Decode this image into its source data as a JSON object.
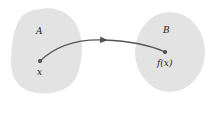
{
  "diagram": {
    "set_a": {
      "label": "A",
      "point_label": "x",
      "fill": "#e3e3e3"
    },
    "set_b": {
      "label": "B",
      "point_label": "f(x)",
      "fill": "#e3e3e3"
    },
    "arrow": {
      "color": "#555555",
      "from": "x",
      "to": "f(x)"
    }
  }
}
